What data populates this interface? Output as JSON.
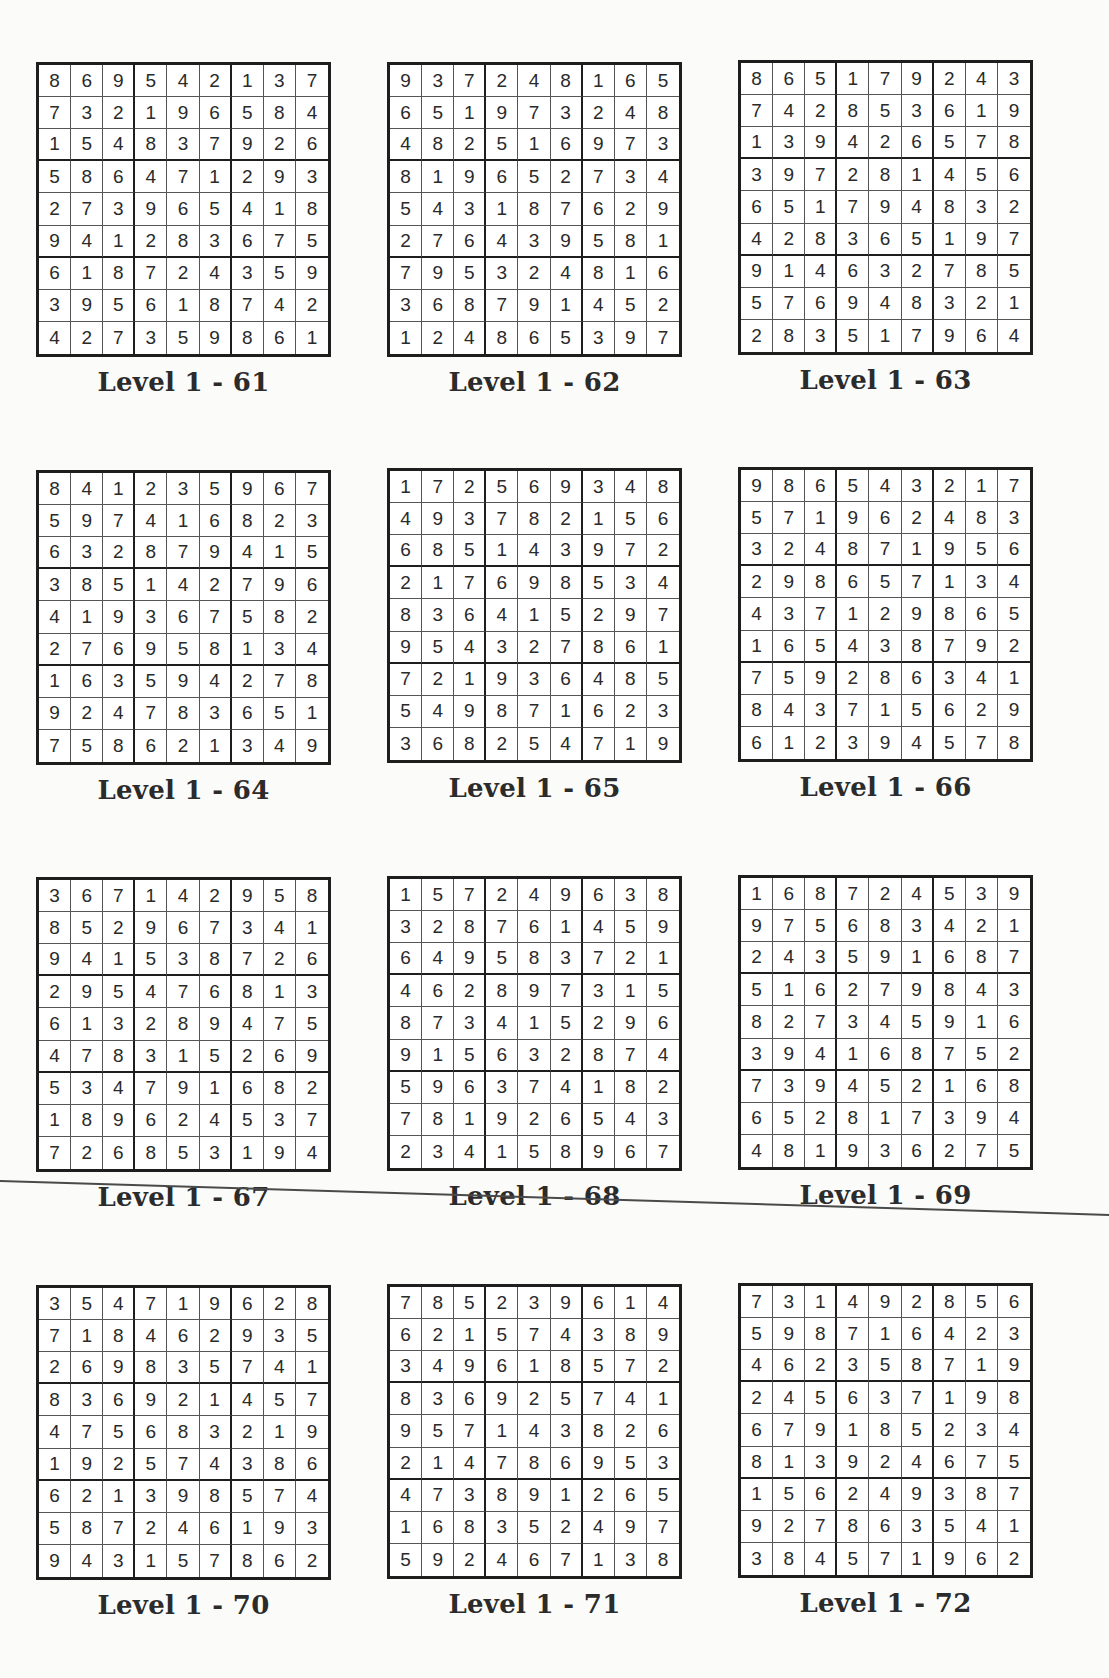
{
  "page": {
    "puzzles": [
      {
        "label": "Level 1 - 61",
        "grid": [
          [
            8,
            6,
            9,
            5,
            4,
            2,
            1,
            3,
            7
          ],
          [
            7,
            3,
            2,
            1,
            9,
            6,
            5,
            8,
            4
          ],
          [
            1,
            5,
            4,
            8,
            3,
            7,
            9,
            2,
            6
          ],
          [
            5,
            8,
            6,
            4,
            7,
            1,
            2,
            9,
            3
          ],
          [
            2,
            7,
            3,
            9,
            6,
            5,
            4,
            1,
            8
          ],
          [
            9,
            4,
            1,
            2,
            8,
            3,
            6,
            7,
            5
          ],
          [
            6,
            1,
            8,
            7,
            2,
            4,
            3,
            5,
            9
          ],
          [
            3,
            9,
            5,
            6,
            1,
            8,
            7,
            4,
            2
          ],
          [
            4,
            2,
            7,
            3,
            5,
            9,
            8,
            6,
            1
          ]
        ]
      },
      {
        "label": "Level 1 - 62",
        "grid": [
          [
            9,
            3,
            7,
            2,
            4,
            8,
            1,
            6,
            5
          ],
          [
            6,
            5,
            1,
            9,
            7,
            3,
            2,
            4,
            8
          ],
          [
            4,
            8,
            2,
            5,
            1,
            6,
            9,
            7,
            3
          ],
          [
            8,
            1,
            9,
            6,
            5,
            2,
            7,
            3,
            4
          ],
          [
            5,
            4,
            3,
            1,
            8,
            7,
            6,
            2,
            9
          ],
          [
            2,
            7,
            6,
            4,
            3,
            9,
            5,
            8,
            1
          ],
          [
            7,
            9,
            5,
            3,
            2,
            4,
            8,
            1,
            6
          ],
          [
            3,
            6,
            8,
            7,
            9,
            1,
            4,
            5,
            2
          ],
          [
            1,
            2,
            4,
            8,
            6,
            5,
            3,
            9,
            7
          ]
        ]
      },
      {
        "label": "Level 1 - 63",
        "grid": [
          [
            8,
            6,
            5,
            1,
            7,
            9,
            2,
            4,
            3
          ],
          [
            7,
            4,
            2,
            8,
            5,
            3,
            6,
            1,
            9
          ],
          [
            1,
            3,
            9,
            4,
            2,
            6,
            5,
            7,
            8
          ],
          [
            3,
            9,
            7,
            2,
            8,
            1,
            4,
            5,
            6
          ],
          [
            6,
            5,
            1,
            7,
            9,
            4,
            8,
            3,
            2
          ],
          [
            4,
            2,
            8,
            3,
            6,
            5,
            1,
            9,
            7
          ],
          [
            9,
            1,
            4,
            6,
            3,
            2,
            7,
            8,
            5
          ],
          [
            5,
            7,
            6,
            9,
            4,
            8,
            3,
            2,
            1
          ],
          [
            2,
            8,
            3,
            5,
            1,
            7,
            9,
            6,
            4
          ]
        ]
      },
      {
        "label": "Level 1 - 64",
        "grid": [
          [
            8,
            4,
            1,
            2,
            3,
            5,
            9,
            6,
            7
          ],
          [
            5,
            9,
            7,
            4,
            1,
            6,
            8,
            2,
            3
          ],
          [
            6,
            3,
            2,
            8,
            7,
            9,
            4,
            1,
            5
          ],
          [
            3,
            8,
            5,
            1,
            4,
            2,
            7,
            9,
            6
          ],
          [
            4,
            1,
            9,
            3,
            6,
            7,
            5,
            8,
            2
          ],
          [
            2,
            7,
            6,
            9,
            5,
            8,
            1,
            3,
            4
          ],
          [
            1,
            6,
            3,
            5,
            9,
            4,
            2,
            7,
            8
          ],
          [
            9,
            2,
            4,
            7,
            8,
            3,
            6,
            5,
            1
          ],
          [
            7,
            5,
            8,
            6,
            2,
            1,
            3,
            4,
            9
          ]
        ]
      },
      {
        "label": "Level 1 - 65",
        "grid": [
          [
            1,
            7,
            2,
            5,
            6,
            9,
            3,
            4,
            8
          ],
          [
            4,
            9,
            3,
            7,
            8,
            2,
            1,
            5,
            6
          ],
          [
            6,
            8,
            5,
            1,
            4,
            3,
            9,
            7,
            2
          ],
          [
            2,
            1,
            7,
            6,
            9,
            8,
            5,
            3,
            4
          ],
          [
            8,
            3,
            6,
            4,
            1,
            5,
            2,
            9,
            7
          ],
          [
            9,
            5,
            4,
            3,
            2,
            7,
            8,
            6,
            1
          ],
          [
            7,
            2,
            1,
            9,
            3,
            6,
            4,
            8,
            5
          ],
          [
            5,
            4,
            9,
            8,
            7,
            1,
            6,
            2,
            3
          ],
          [
            3,
            6,
            8,
            2,
            5,
            4,
            7,
            1,
            9
          ]
        ]
      },
      {
        "label": "Level 1 - 66",
        "grid": [
          [
            9,
            8,
            6,
            5,
            4,
            3,
            2,
            1,
            7
          ],
          [
            5,
            7,
            1,
            9,
            6,
            2,
            4,
            8,
            3
          ],
          [
            3,
            2,
            4,
            8,
            7,
            1,
            9,
            5,
            6
          ],
          [
            2,
            9,
            8,
            6,
            5,
            7,
            1,
            3,
            4
          ],
          [
            4,
            3,
            7,
            1,
            2,
            9,
            8,
            6,
            5
          ],
          [
            1,
            6,
            5,
            4,
            3,
            8,
            7,
            9,
            2
          ],
          [
            7,
            5,
            9,
            2,
            8,
            6,
            3,
            4,
            1
          ],
          [
            8,
            4,
            3,
            7,
            1,
            5,
            6,
            2,
            9
          ],
          [
            6,
            1,
            2,
            3,
            9,
            4,
            5,
            7,
            8
          ]
        ]
      },
      {
        "label": "Level 1 - 67",
        "grid": [
          [
            3,
            6,
            7,
            1,
            4,
            2,
            9,
            5,
            8
          ],
          [
            8,
            5,
            2,
            9,
            6,
            7,
            3,
            4,
            1
          ],
          [
            9,
            4,
            1,
            5,
            3,
            8,
            7,
            2,
            6
          ],
          [
            2,
            9,
            5,
            4,
            7,
            6,
            8,
            1,
            3
          ],
          [
            6,
            1,
            3,
            2,
            8,
            9,
            4,
            7,
            5
          ],
          [
            4,
            7,
            8,
            3,
            1,
            5,
            2,
            6,
            9
          ],
          [
            5,
            3,
            4,
            7,
            9,
            1,
            6,
            8,
            2
          ],
          [
            1,
            8,
            9,
            6,
            2,
            4,
            5,
            3,
            7
          ],
          [
            7,
            2,
            6,
            8,
            5,
            3,
            1,
            9,
            4
          ]
        ]
      },
      {
        "label": "Level 1 - 68",
        "grid": [
          [
            1,
            5,
            7,
            2,
            4,
            9,
            6,
            3,
            8
          ],
          [
            3,
            2,
            8,
            7,
            6,
            1,
            4,
            5,
            9
          ],
          [
            6,
            4,
            9,
            5,
            8,
            3,
            7,
            2,
            1
          ],
          [
            4,
            6,
            2,
            8,
            9,
            7,
            3,
            1,
            5
          ],
          [
            8,
            7,
            3,
            4,
            1,
            5,
            2,
            9,
            6
          ],
          [
            9,
            1,
            5,
            6,
            3,
            2,
            8,
            7,
            4
          ],
          [
            5,
            9,
            6,
            3,
            7,
            4,
            1,
            8,
            2
          ],
          [
            7,
            8,
            1,
            9,
            2,
            6,
            5,
            4,
            3
          ],
          [
            2,
            3,
            4,
            1,
            5,
            8,
            9,
            6,
            7
          ]
        ]
      },
      {
        "label": "Level 1 - 69",
        "grid": [
          [
            1,
            6,
            8,
            7,
            2,
            4,
            5,
            3,
            9
          ],
          [
            9,
            7,
            5,
            6,
            8,
            3,
            4,
            2,
            1
          ],
          [
            2,
            4,
            3,
            5,
            9,
            1,
            6,
            8,
            7
          ],
          [
            5,
            1,
            6,
            2,
            7,
            9,
            8,
            4,
            3
          ],
          [
            8,
            2,
            7,
            3,
            4,
            5,
            9,
            1,
            6
          ],
          [
            3,
            9,
            4,
            1,
            6,
            8,
            7,
            5,
            2
          ],
          [
            7,
            3,
            9,
            4,
            5,
            2,
            1,
            6,
            8
          ],
          [
            6,
            5,
            2,
            8,
            1,
            7,
            3,
            9,
            4
          ],
          [
            4,
            8,
            1,
            9,
            3,
            6,
            2,
            7,
            5
          ]
        ]
      },
      {
        "label": "Level 1 - 70",
        "grid": [
          [
            3,
            5,
            4,
            7,
            1,
            9,
            6,
            2,
            8
          ],
          [
            7,
            1,
            8,
            4,
            6,
            2,
            9,
            3,
            5
          ],
          [
            2,
            6,
            9,
            8,
            3,
            5,
            7,
            4,
            1
          ],
          [
            8,
            3,
            6,
            9,
            2,
            1,
            4,
            5,
            7
          ],
          [
            4,
            7,
            5,
            6,
            8,
            3,
            2,
            1,
            9
          ],
          [
            1,
            9,
            2,
            5,
            7,
            4,
            3,
            8,
            6
          ],
          [
            6,
            2,
            1,
            3,
            9,
            8,
            5,
            7,
            4
          ],
          [
            5,
            8,
            7,
            2,
            4,
            6,
            1,
            9,
            3
          ],
          [
            9,
            4,
            3,
            1,
            5,
            7,
            8,
            6,
            2
          ]
        ]
      },
      {
        "label": "Level 1 - 71",
        "grid": [
          [
            7,
            8,
            5,
            2,
            3,
            9,
            6,
            1,
            4
          ],
          [
            6,
            2,
            1,
            5,
            7,
            4,
            3,
            8,
            9
          ],
          [
            3,
            4,
            9,
            6,
            1,
            8,
            5,
            7,
            2
          ],
          [
            8,
            3,
            6,
            9,
            2,
            5,
            7,
            4,
            1
          ],
          [
            9,
            5,
            7,
            1,
            4,
            3,
            8,
            2,
            6
          ],
          [
            2,
            1,
            4,
            7,
            8,
            6,
            9,
            5,
            3
          ],
          [
            4,
            7,
            3,
            8,
            9,
            1,
            2,
            6,
            5
          ],
          [
            1,
            6,
            8,
            3,
            5,
            2,
            4,
            9,
            7
          ],
          [
            5,
            9,
            2,
            4,
            6,
            7,
            1,
            3,
            8
          ]
        ]
      },
      {
        "label": "Level 1 - 72",
        "grid": [
          [
            7,
            3,
            1,
            4,
            9,
            2,
            8,
            5,
            6
          ],
          [
            5,
            9,
            8,
            7,
            1,
            6,
            4,
            2,
            3
          ],
          [
            4,
            6,
            2,
            3,
            5,
            8,
            7,
            1,
            9
          ],
          [
            2,
            4,
            5,
            6,
            3,
            7,
            1,
            9,
            8
          ],
          [
            6,
            7,
            9,
            1,
            8,
            5,
            2,
            3,
            4
          ],
          [
            8,
            1,
            3,
            9,
            2,
            4,
            6,
            7,
            5
          ],
          [
            1,
            5,
            6,
            2,
            4,
            9,
            3,
            8,
            7
          ],
          [
            9,
            2,
            7,
            8,
            6,
            3,
            5,
            4,
            1
          ],
          [
            3,
            8,
            4,
            5,
            7,
            1,
            9,
            6,
            2
          ]
        ]
      }
    ]
  }
}
